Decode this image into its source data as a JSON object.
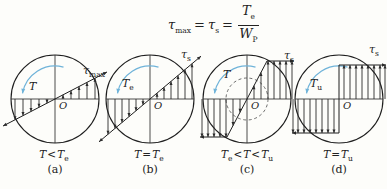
{
  "colors": {
    "ink": "#1f1f1f",
    "arrow": "#2b2b2b",
    "torque_arrow": "#6fb3d9",
    "dashed": "#4a4a4a"
  },
  "formula": {
    "lhs_base": "τ",
    "lhs_sub": "max",
    "eq1": "=",
    "mid_base": "τ",
    "mid_sub": "s",
    "eq2": "=",
    "frac": {
      "num_base": "T",
      "num_sub": "e",
      "den_base": "W",
      "den_sub": "P"
    }
  },
  "diagrams": [
    {
      "letter": "(a)",
      "cond": {
        "b1": "T",
        "s1": "",
        "op1": "<",
        "b2": "T",
        "s2": "e",
        "op2": "",
        "b3": "",
        "s3": ""
      },
      "torque_base": "T",
      "torque_sub": "",
      "apex_base": "τ",
      "apex_sub": "max",
      "origin": "O"
    },
    {
      "letter": "(b)",
      "cond": {
        "b1": "T",
        "s1": "",
        "op1": "=",
        "b2": "T",
        "s2": "e",
        "op2": "",
        "b3": "",
        "s3": ""
      },
      "torque_base": "T",
      "torque_sub": "e",
      "apex_base": "τ",
      "apex_sub": "s",
      "origin": "O"
    },
    {
      "letter": "(c)",
      "cond": {
        "b1": "T",
        "s1": "e",
        "op1": "<",
        "b2": "T",
        "s2": "",
        "op2": "<",
        "b3": "T",
        "s3": "u"
      },
      "torque_base": "T",
      "torque_sub": "",
      "apex_base": "τ",
      "apex_sub": "s",
      "origin": "O"
    },
    {
      "letter": "(d)",
      "cond": {
        "b1": "T",
        "s1": "",
        "op1": "=",
        "b2": "T",
        "s2": "u",
        "op2": "",
        "b3": "",
        "s3": ""
      },
      "torque_base": "T",
      "torque_sub": "u",
      "apex_base": "τ",
      "apex_sub": "s",
      "origin": "O"
    }
  ]
}
